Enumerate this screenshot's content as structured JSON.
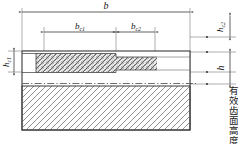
{
  "diagram": {
    "dimensions": {
      "b": "b",
      "bc1": "b",
      "bc1_sub": "c1",
      "bc2": "b",
      "bc2_sub": "c2",
      "hc1": "h",
      "hc1_sub": "c1",
      "hc2": "h",
      "hc2_sub": "c2",
      "h": "h"
    },
    "annotation": {
      "effective_flank_height": "有效齿面高度"
    },
    "colors": {
      "line": "#3a3a3a",
      "thin_line": "#6b6b6b",
      "hatch": "#555555",
      "body_hatch": "#777777",
      "background": "#ffffff"
    }
  }
}
